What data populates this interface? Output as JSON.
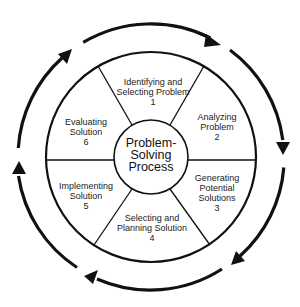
{
  "center": {
    "line1": "Problem-",
    "line2": "Solving",
    "line3": "Process"
  },
  "steps": [
    {
      "number": "1",
      "line1": "Identifying and",
      "line2": "Selecting Problem",
      "line3": ""
    },
    {
      "number": "2",
      "line1": "Analyzing",
      "line2": "Problem",
      "line3": ""
    },
    {
      "number": "3",
      "line1": "Generating",
      "line2": "Potential",
      "line3": "Solutions"
    },
    {
      "number": "4",
      "line1": "Selecting and",
      "line2": "Planning Solution",
      "line3": ""
    },
    {
      "number": "5",
      "line1": "Implementing",
      "line2": "Solution",
      "line3": ""
    },
    {
      "number": "6",
      "line1": "Evaluating",
      "line2": "Solution",
      "line3": ""
    }
  ],
  "cycle_direction": "clockwise",
  "colors": {
    "line": "#111111",
    "background": "#ffffff"
  }
}
